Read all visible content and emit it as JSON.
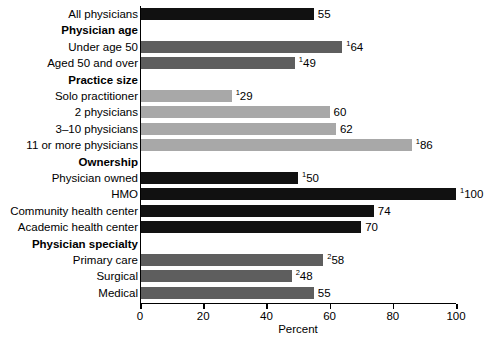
{
  "chart_data": {
    "type": "bar",
    "orientation": "horizontal",
    "title": "",
    "xlabel": "Percent",
    "ylabel": "",
    "xlim": [
      0,
      100
    ],
    "xticks": [
      0,
      20,
      40,
      60,
      80,
      100
    ],
    "grid": false,
    "legend": null,
    "categories": [
      "All physicians",
      "Physician age",
      "Under age 50",
      "Aged 50 and over",
      "Practice size",
      "Solo practitioner",
      "2 physicians",
      "3–10 physicians",
      "11 or more physicians",
      "Ownership",
      "Physician owned",
      "HMO",
      "Community health center",
      "Academic health center",
      "Physician specialty",
      "Primary care",
      "Surgical",
      "Medical"
    ],
    "values": [
      55,
      null,
      64,
      49,
      null,
      29,
      60,
      62,
      86,
      null,
      50,
      100,
      74,
      70,
      null,
      58,
      48,
      55
    ],
    "value_labels": [
      "55",
      "",
      "64",
      "49",
      "",
      "29",
      "60",
      "62",
      "86",
      "",
      "50",
      "100",
      "74",
      "70",
      "",
      "58",
      "48",
      "55"
    ],
    "value_footnotes": [
      "",
      "",
      "1",
      "1",
      "",
      "1",
      "",
      "",
      "1",
      "",
      "1",
      "1",
      "",
      "",
      "",
      "2",
      "2",
      ""
    ]
  },
  "rows": [
    {
      "label": "All physicians",
      "group": false,
      "value": 55,
      "value_label": "55",
      "footnote": "",
      "color": "#111111"
    },
    {
      "label": "Physician age",
      "group": true,
      "value": null,
      "value_label": "",
      "footnote": "",
      "color": ""
    },
    {
      "label": "Under age 50",
      "group": false,
      "value": 64,
      "value_label": "64",
      "footnote": "1",
      "color": "#5e5e5e"
    },
    {
      "label": "Aged 50 and over",
      "group": false,
      "value": 49,
      "value_label": "49",
      "footnote": "1",
      "color": "#5e5e5e"
    },
    {
      "label": "Practice size",
      "group": true,
      "value": null,
      "value_label": "",
      "footnote": "",
      "color": ""
    },
    {
      "label": "Solo practitioner",
      "group": false,
      "value": 29,
      "value_label": "29",
      "footnote": "1",
      "color": "#a8a8a8"
    },
    {
      "label": "2 physicians",
      "group": false,
      "value": 60,
      "value_label": "60",
      "footnote": "",
      "color": "#a8a8a8"
    },
    {
      "label": "3–10 physicians",
      "group": false,
      "value": 62,
      "value_label": "62",
      "footnote": "",
      "color": "#a8a8a8"
    },
    {
      "label": "11 or more physicians",
      "group": false,
      "value": 86,
      "value_label": "86",
      "footnote": "1",
      "color": "#a8a8a8"
    },
    {
      "label": "Ownership",
      "group": true,
      "value": null,
      "value_label": "",
      "footnote": "",
      "color": ""
    },
    {
      "label": "Physician owned",
      "group": false,
      "value": 50,
      "value_label": "50",
      "footnote": "1",
      "color": "#111111"
    },
    {
      "label": "HMO",
      "group": false,
      "value": 100,
      "value_label": "100",
      "footnote": "1",
      "color": "#111111"
    },
    {
      "label": "Community health center",
      "group": false,
      "value": 74,
      "value_label": "74",
      "footnote": "",
      "color": "#111111"
    },
    {
      "label": "Academic health center",
      "group": false,
      "value": 70,
      "value_label": "70",
      "footnote": "",
      "color": "#111111"
    },
    {
      "label": "Physician specialty",
      "group": true,
      "value": null,
      "value_label": "",
      "footnote": "",
      "color": ""
    },
    {
      "label": "Primary care",
      "group": false,
      "value": 58,
      "value_label": "58",
      "footnote": "2",
      "color": "#5e5e5e"
    },
    {
      "label": "Surgical",
      "group": false,
      "value": 48,
      "value_label": "48",
      "footnote": "2",
      "color": "#5e5e5e"
    },
    {
      "label": "Medical",
      "group": false,
      "value": 55,
      "value_label": "55",
      "footnote": "",
      "color": "#5e5e5e"
    }
  ],
  "axis": {
    "title": "Percent",
    "ticks": [
      {
        "value": 0,
        "label": "0"
      },
      {
        "value": 20,
        "label": "20"
      },
      {
        "value": 40,
        "label": "40"
      },
      {
        "value": 60,
        "label": "60"
      },
      {
        "value": 80,
        "label": "80"
      },
      {
        "value": 100,
        "label": "100"
      }
    ]
  }
}
